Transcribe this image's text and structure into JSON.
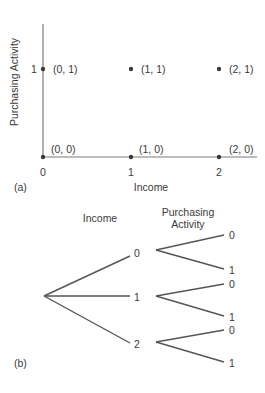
{
  "panel_a": {
    "label": "(a)",
    "x_axis": {
      "title": "Income",
      "ticks": [
        "0",
        "1",
        "2"
      ]
    },
    "y_axis": {
      "title": "Purchasing Activity",
      "ticks": [
        "1"
      ]
    },
    "points": [
      {
        "label": "(0, 1)"
      },
      {
        "label": "(1, 1)"
      },
      {
        "label": "(2, 1)"
      },
      {
        "label": "(0, 0)"
      },
      {
        "label": "(1, 0)"
      },
      {
        "label": "(2, 0)"
      }
    ]
  },
  "panel_b": {
    "label": "(b)",
    "level1_header": "Income",
    "level2_header_line1": "Purchasing",
    "level2_header_line2": "Activity",
    "income_nodes": [
      "0",
      "1",
      "2"
    ],
    "purchase_nodes": [
      [
        "0",
        "1"
      ],
      [
        "0",
        "1"
      ],
      [
        "0",
        "1"
      ]
    ]
  },
  "colors": {
    "axis": "#7a7a7a",
    "branch": "#555555",
    "text": "#3a3a3a"
  }
}
